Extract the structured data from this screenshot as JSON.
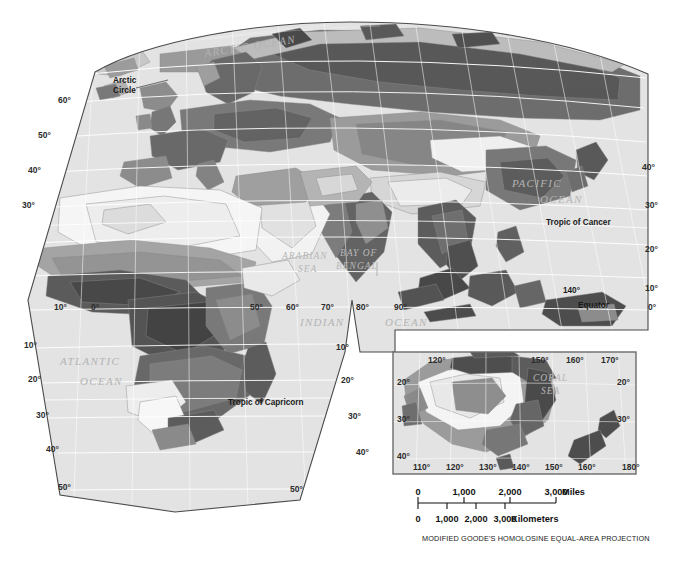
{
  "map": {
    "title": "Eastern Hemisphere Vegetation Map",
    "projection_caption": "MODIFIED GOODE'S HOMOLOSINE EQUAL-AREA PROJECTION",
    "background_color": "#ffffff",
    "ocean_color": "#e3e3e3",
    "graticule_color": "#ffffff",
    "outline_color": "#4a4a4a"
  },
  "ocean_labels": [
    {
      "text": "ARCTIC  OCEAN",
      "x": 205,
      "y": 57,
      "rotate": -9,
      "size": "lg"
    },
    {
      "text": "ATLANTIC",
      "x": 60,
      "y": 365,
      "rotate": 0,
      "size": "lg"
    },
    {
      "text": "OCEAN",
      "x": 80,
      "y": 385,
      "rotate": 0,
      "size": "lg"
    },
    {
      "text": "ARABIAN",
      "x": 282,
      "y": 259,
      "rotate": 0,
      "size": "sm"
    },
    {
      "text": "SEA",
      "x": 298,
      "y": 272,
      "rotate": 0,
      "size": "sm"
    },
    {
      "text": "BAY OF",
      "x": 340,
      "y": 256,
      "rotate": 0,
      "size": "sm"
    },
    {
      "text": "BENGAL",
      "x": 336,
      "y": 269,
      "rotate": 0,
      "size": "sm"
    },
    {
      "text": "INDIAN",
      "x": 300,
      "y": 326,
      "rotate": 0,
      "size": "lg"
    },
    {
      "text": "OCEAN",
      "x": 385,
      "y": 326,
      "rotate": 0,
      "size": "lg"
    },
    {
      "text": "PACIFIC",
      "x": 512,
      "y": 187,
      "rotate": 0,
      "size": "lg"
    },
    {
      "text": "OCEAN",
      "x": 540,
      "y": 203,
      "rotate": 0,
      "size": "lg"
    }
  ],
  "annotations": [
    {
      "text": "Arctic",
      "x": 113,
      "y": 83
    },
    {
      "text": "Circle",
      "x": 113,
      "y": 93
    },
    {
      "text": "Tropic of Cancer",
      "x": 546,
      "y": 225
    },
    {
      "text": "Equator",
      "x": 578,
      "y": 308
    },
    {
      "text": "Tropic of Capricorn",
      "x": 228,
      "y": 405
    },
    {
      "text": "140°",
      "x": 563,
      "y": 293
    }
  ],
  "main_lat_labels_left": [
    {
      "text": "60°",
      "x": 58,
      "y": 103
    },
    {
      "text": "50°",
      "x": 38,
      "y": 138
    },
    {
      "text": "40°",
      "x": 28,
      "y": 173
    },
    {
      "text": "30°",
      "x": 22,
      "y": 208
    },
    {
      "text": "10°",
      "x": 24,
      "y": 348
    },
    {
      "text": "20°",
      "x": 28,
      "y": 382
    },
    {
      "text": "30°",
      "x": 36,
      "y": 418
    },
    {
      "text": "40°",
      "x": 46,
      "y": 452
    },
    {
      "text": "50°",
      "x": 58,
      "y": 490
    }
  ],
  "main_lat_labels_right": [
    {
      "text": "40°",
      "x": 642,
      "y": 170
    },
    {
      "text": "30°",
      "x": 645,
      "y": 208
    },
    {
      "text": "20°",
      "x": 645,
      "y": 252
    },
    {
      "text": "10°",
      "x": 645,
      "y": 291
    },
    {
      "text": "0°",
      "x": 648,
      "y": 310
    },
    {
      "text": "10°",
      "x": 336,
      "y": 350
    },
    {
      "text": "20°",
      "x": 341,
      "y": 383
    },
    {
      "text": "30°",
      "x": 348,
      "y": 419
    },
    {
      "text": "40°",
      "x": 356,
      "y": 455
    },
    {
      "text": "50°",
      "x": 290,
      "y": 492
    }
  ],
  "main_lon_labels": [
    {
      "text": "10°",
      "x": 54,
      "y": 310
    },
    {
      "text": "0°",
      "x": 91,
      "y": 310
    },
    {
      "text": "50°",
      "x": 250,
      "y": 310
    },
    {
      "text": "60°",
      "x": 286,
      "y": 310
    },
    {
      "text": "70°",
      "x": 321,
      "y": 310
    },
    {
      "text": "80°",
      "x": 356,
      "y": 310
    },
    {
      "text": "90°",
      "x": 394,
      "y": 310
    }
  ],
  "inset": {
    "name": "australia-new-zealand-inset",
    "x": 393,
    "y": 352,
    "width": 243,
    "height": 122,
    "ocean_labels": [
      {
        "text": "CORAL",
        "x": 533,
        "y": 381
      },
      {
        "text": "SEA",
        "x": 541,
        "y": 394
      }
    ],
    "lat_labels_left": [
      {
        "text": "20°",
        "x": 397,
        "y": 385
      },
      {
        "text": "30°",
        "x": 397,
        "y": 422
      },
      {
        "text": "40°",
        "x": 397,
        "y": 459
      }
    ],
    "lat_labels_right": [
      {
        "text": "20°",
        "x": 617,
        "y": 385
      },
      {
        "text": "30°",
        "x": 617,
        "y": 422
      }
    ],
    "lon_labels_top": [
      {
        "text": "120°",
        "x": 428,
        "y": 363
      },
      {
        "text": "150°",
        "x": 531,
        "y": 363
      },
      {
        "text": "160°",
        "x": 566,
        "y": 363
      },
      {
        "text": "170°",
        "x": 601,
        "y": 363
      }
    ],
    "lon_labels_bottom": [
      {
        "text": "110°",
        "x": 413,
        "y": 470
      },
      {
        "text": "120°",
        "x": 446,
        "y": 470
      },
      {
        "text": "130°",
        "x": 479,
        "y": 470
      },
      {
        "text": "140°",
        "x": 512,
        "y": 470
      },
      {
        "text": "150°",
        "x": 545,
        "y": 470
      },
      {
        "text": "160°",
        "x": 578,
        "y": 470
      },
      {
        "text": "180°",
        "x": 622,
        "y": 470
      }
    ]
  },
  "scale": {
    "miles": {
      "unit_label": "Miles",
      "ticks": [
        "0",
        "1,000",
        "2,000",
        "3,000"
      ],
      "tick_x": [
        418,
        464,
        510,
        556
      ],
      "label_y": 495,
      "bar_y": 503
    },
    "kilometers": {
      "unit_label": "Kilometers",
      "ticks": [
        "0",
        "1,000",
        "2,000",
        "3,000"
      ],
      "tick_x": [
        418,
        447,
        476,
        505
      ],
      "label_y": 522,
      "bar_y": 503
    }
  }
}
